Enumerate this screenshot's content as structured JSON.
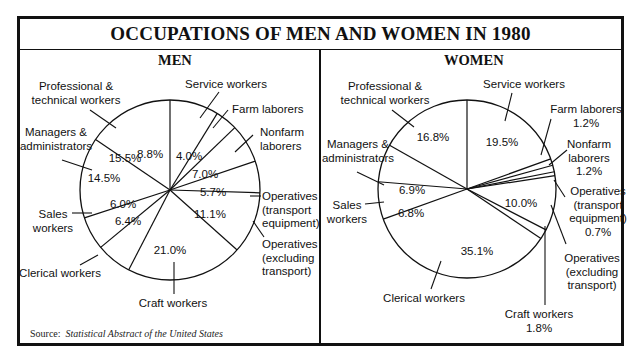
{
  "title": "OCCUPATIONS OF MEN AND WOMEN IN 1980",
  "source": {
    "prefix": "Source:",
    "text": "Statistical Abstract of the United States"
  },
  "colors": {
    "line": "#111111",
    "background": "#ffffff"
  },
  "chart_data": [
    {
      "type": "pie",
      "title": "MEN",
      "start": "12 o'clock, clockwise",
      "categories": [
        "Service workers",
        "Farm laborers",
        "Nonfarm laborers",
        "Operatives (transport equipment)",
        "Operatives (excluding transport)",
        "Craft workers",
        "Clerical workers",
        "Sales workers",
        "Managers & administrators",
        "Professional & technical workers"
      ],
      "values": [
        8.8,
        4.0,
        7.0,
        5.7,
        11.1,
        21.0,
        6.4,
        6.0,
        14.5,
        15.5
      ],
      "value_labels": [
        "8.8%",
        "4.0%",
        "7.0%",
        "5.7%",
        "11.1%",
        "21.0%",
        "6.4%",
        "6.0%",
        "14.5%",
        "15.5%"
      ],
      "center": [
        170,
        190
      ],
      "radius": 90,
      "pct_pos": [
        [
          150,
          158
        ],
        [
          189,
          160
        ],
        [
          205,
          178
        ],
        [
          213,
          196
        ],
        [
          210,
          218
        ],
        [
          170,
          254
        ],
        [
          128,
          225
        ],
        [
          123,
          208
        ],
        [
          104,
          182
        ],
        [
          125,
          162
        ]
      ],
      "labels": [
        {
          "lines": [
            "Service workers"
          ],
          "x": 226,
          "y": 88,
          "anchor": "middle",
          "leader": [
            [
              219,
              92
            ],
            [
              200,
              118
            ]
          ]
        },
        {
          "lines": [
            "Farm laborers"
          ],
          "x": 232,
          "y": 113,
          "anchor": "start",
          "leader": [
            [
              228,
              110
            ],
            [
              213,
              128
            ]
          ]
        },
        {
          "lines": [
            "Nonfarm",
            "laborers"
          ],
          "x": 260,
          "y": 136,
          "anchor": "start",
          "leader": [
            [
              253,
              135
            ],
            [
              235,
              152
            ]
          ]
        },
        {
          "lines": [
            "Operatives",
            "(transport",
            "equipment)"
          ],
          "x": 262,
          "y": 200,
          "anchor": "start",
          "leader": [
            [
              250,
              196
            ],
            [
              261,
              196
            ]
          ]
        },
        {
          "lines": [
            "Operatives",
            "(excluding",
            "transport)"
          ],
          "x": 262,
          "y": 248,
          "anchor": "start",
          "leader": [
            [
              253,
              221
            ],
            [
              264,
              237
            ]
          ]
        },
        {
          "lines": [
            "Craft workers"
          ],
          "x": 173,
          "y": 307,
          "anchor": "middle",
          "leader": [
            [
              174,
              262
            ],
            [
              174,
              294
            ]
          ]
        },
        {
          "lines": [
            "Clerical workers"
          ],
          "x": 60,
          "y": 277,
          "anchor": "middle",
          "leader": [
            [
              98,
              255
            ],
            [
              80,
              265
            ]
          ]
        },
        {
          "lines": [
            "Sales",
            "workers"
          ],
          "x": 53,
          "y": 218,
          "anchor": "middle",
          "leader": [
            [
              72,
              213
            ],
            [
              92,
              213
            ]
          ]
        },
        {
          "lines": [
            "Managers &",
            "administrators"
          ],
          "x": 56,
          "y": 136,
          "anchor": "middle",
          "leader": [
            [
              62,
              160
            ],
            [
              92,
              170
            ]
          ]
        },
        {
          "lines": [
            "Professional &",
            "technical workers"
          ],
          "x": 76,
          "y": 90,
          "anchor": "middle",
          "leader": [
            [
              90,
              110
            ],
            [
              116,
              128
            ]
          ]
        }
      ]
    },
    {
      "type": "pie",
      "title": "WOMEN",
      "start": "12 o'clock, clockwise",
      "categories": [
        "Service workers",
        "Farm laborers",
        "Nonfarm laborers",
        "Operatives (transport equipment)",
        "Operatives (excluding transport)",
        "Craft workers",
        "Clerical workers",
        "Sales workers",
        "Managers & administrators",
        "Professional & technical workers"
      ],
      "values": [
        19.5,
        1.2,
        1.2,
        0.7,
        10.0,
        1.8,
        35.1,
        6.8,
        6.9,
        16.8
      ],
      "value_labels": [
        "19.5%",
        "1.2%",
        "1.2%",
        "0.7%",
        "10.0%",
        "1.8%",
        "35.1%",
        "6.8%",
        "6.9%",
        "16.8%"
      ],
      "center": [
        467,
        189
      ],
      "radius": 89,
      "pct_pos": [
        [
          502,
          146
        ],
        null,
        null,
        null,
        [
          521,
          207
        ],
        null,
        [
          477,
          255
        ],
        [
          411,
          217
        ],
        [
          412,
          194
        ],
        [
          433,
          141
        ]
      ],
      "labels": [
        {
          "lines": [
            "Service workers"
          ],
          "x": 524,
          "y": 88,
          "anchor": "middle",
          "leader": [
            [
              512,
              93
            ],
            [
              505,
              121
            ]
          ]
        },
        {
          "lines": [
            "Farm laborers",
            "1.2%"
          ],
          "x": 586,
          "y": 113,
          "anchor": "middle",
          "leader": [
            [
              551,
              119
            ],
            [
              541,
              155
            ]
          ]
        },
        {
          "lines": [
            "Nonfarm",
            "laborers",
            "1.2%"
          ],
          "x": 589,
          "y": 148,
          "anchor": "middle",
          "leader": [
            [
              567,
              150
            ],
            [
              549,
              165
            ]
          ]
        },
        {
          "lines": [
            "Operatives",
            "(transport",
            "equipment)",
            "0.7%"
          ],
          "x": 598,
          "y": 195,
          "anchor": "middle",
          "leader": [
            [
              565,
              197
            ],
            [
              554,
              180
            ]
          ]
        },
        {
          "lines": [
            "Operatives",
            "(excluding",
            "transport)"
          ],
          "x": 592,
          "y": 262,
          "anchor": "middle",
          "leader": [
            [
              566,
              244
            ],
            [
              551,
              205
            ]
          ]
        },
        {
          "lines": [
            "Craft workers",
            "1.8%"
          ],
          "x": 539,
          "y": 318,
          "anchor": "middle",
          "leader": [
            [
              545,
              226
            ],
            [
              545,
              305
            ]
          ]
        },
        {
          "lines": [
            "Clerical workers"
          ],
          "x": 424,
          "y": 302,
          "anchor": "middle",
          "leader": [
            [
              441,
              261
            ],
            [
              431,
              289
            ]
          ]
        },
        {
          "lines": [
            "Sales",
            "workers"
          ],
          "x": 347,
          "y": 209,
          "anchor": "middle",
          "leader": [
            [
              365,
              204
            ],
            [
              384,
              202
            ]
          ]
        },
        {
          "lines": [
            "Managers &",
            "administrators"
          ],
          "x": 358,
          "y": 148,
          "anchor": "middle",
          "leader": [
            [
              357,
              172
            ],
            [
              384,
              185
            ]
          ]
        },
        {
          "lines": [
            "Professional &",
            "technical workers"
          ],
          "x": 385,
          "y": 90,
          "anchor": "middle",
          "leader": [
            [
              392,
              110
            ],
            [
              414,
              127
            ]
          ]
        }
      ]
    }
  ]
}
